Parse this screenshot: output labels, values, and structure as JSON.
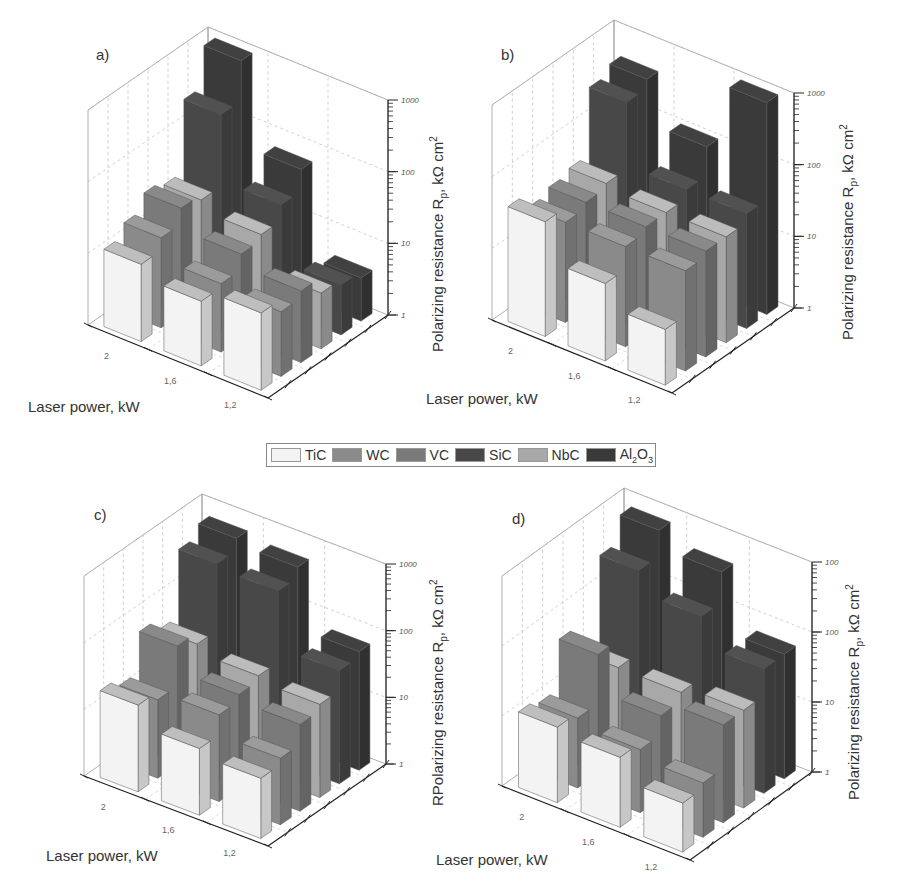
{
  "legend": {
    "items": [
      {
        "label": "TiC",
        "color": "#f3f3f3"
      },
      {
        "label": "WC",
        "color": "#8a8a8a"
      },
      {
        "label": "VC",
        "color": "#7a7a7a"
      },
      {
        "label": "SiC",
        "color": "#484848"
      },
      {
        "label": "NbC",
        "color": "#a8a8a8"
      },
      {
        "label": "Al2O3",
        "color": "#3a3a3a"
      }
    ]
  },
  "chart_data": [
    {
      "type": "bar3d",
      "panel": "a)",
      "title": "a)",
      "xlabel": "Laser power, kW",
      "ylabel": "Polarizing resistance R_p, kΩ cm²",
      "categories": [
        "2",
        "1,6",
        "1,2"
      ],
      "z_ticks": [
        "1",
        "10",
        "100",
        "1000"
      ],
      "zscale": "log",
      "zlim": [
        1,
        1000
      ],
      "series": [
        {
          "name": "TiC",
          "values": [
            12,
            8,
            12
          ]
        },
        {
          "name": "WC",
          "values": [
            18,
            9,
            8
          ]
        },
        {
          "name": "VC",
          "values": [
            30,
            15,
            10
          ]
        },
        {
          "name": "NbC",
          "values": [
            25,
            18,
            6
          ]
        },
        {
          "name": "SiC",
          "values": [
            250,
            30,
            5
          ]
        },
        {
          "name": "Al2O3",
          "values": [
            900,
            60,
            4
          ]
        }
      ]
    },
    {
      "type": "bar3d",
      "panel": "b)",
      "title": "b)",
      "xlabel": "Laser power, kW",
      "ylabel": "Polarizing resistance R_p, kΩ cm²",
      "categories": [
        "2",
        "1,6",
        "1,2"
      ],
      "z_ticks": [
        "1",
        "10",
        "100",
        "1000"
      ],
      "zscale": "log",
      "zlim": [
        1,
        1000
      ],
      "series": [
        {
          "name": "TiC",
          "values": [
            40,
            12,
            6
          ]
        },
        {
          "name": "WC",
          "values": [
            25,
            25,
            25
          ]
        },
        {
          "name": "VC",
          "values": [
            30,
            30,
            30
          ]
        },
        {
          "name": "NbC",
          "values": [
            35,
            30,
            30
          ]
        },
        {
          "name": "SiC",
          "values": [
            300,
            40,
            40
          ]
        },
        {
          "name": "Al2O3",
          "values": [
            400,
            100,
            900
          ]
        }
      ]
    },
    {
      "type": "bar3d",
      "panel": "c)",
      "title": "c)",
      "xlabel": "Laser power, kW",
      "ylabel": "RPolarizing resistance R_p, kΩ cm²",
      "categories": [
        "2",
        "1,6",
        "1,2"
      ],
      "z_ticks": [
        "1",
        "10",
        "100",
        "1000"
      ],
      "zscale": "log",
      "zlim": [
        1,
        1000
      ],
      "series": [
        {
          "name": "TiC",
          "values": [
            20,
            10,
            8
          ]
        },
        {
          "name": "WC",
          "values": [
            15,
            20,
            10
          ]
        },
        {
          "name": "VC",
          "values": [
            60,
            25,
            20
          ]
        },
        {
          "name": "NbC",
          "values": [
            40,
            30,
            25
          ]
        },
        {
          "name": "SiC",
          "values": [
            400,
            350,
            50
          ]
        },
        {
          "name": "Al2O3",
          "values": [
            600,
            500,
            60
          ]
        }
      ]
    },
    {
      "type": "bar3d",
      "panel": "d)",
      "title": "d)",
      "xlabel": "Laser power, kW",
      "ylabel": "Polarizing resistance R_p, kΩ cm²",
      "categories": [
        "2",
        "1,6",
        "1,2"
      ],
      "z_ticks": [
        "1",
        "10",
        "100",
        "100"
      ],
      "zscale": "log",
      "zlim": [
        1,
        1000
      ],
      "series": [
        {
          "name": "TiC",
          "values": [
            12,
            10,
            5
          ]
        },
        {
          "name": "WC",
          "values": [
            10,
            8,
            6
          ]
        },
        {
          "name": "VC",
          "values": [
            50,
            15,
            25
          ]
        },
        {
          "name": "NbC",
          "values": [
            20,
            20,
            25
          ]
        },
        {
          "name": "SiC",
          "values": [
            300,
            150,
            60
          ]
        },
        {
          "name": "Al2O3",
          "values": [
            700,
            400,
            60
          ]
        }
      ]
    }
  ]
}
